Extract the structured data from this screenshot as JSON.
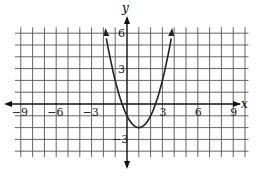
{
  "chart_data": {
    "type": "line",
    "title": "",
    "xlabel": "x",
    "ylabel": "y",
    "function": "y = (x-1)^2 - 2",
    "xlim": [
      -10,
      10
    ],
    "ylim": [
      -5,
      7
    ],
    "x_ticks": [
      "-9",
      "-6",
      "-3",
      "3",
      "6",
      "9"
    ],
    "y_ticks": [
      "6",
      "3",
      "-3"
    ],
    "grid": true,
    "vertex": [
      1,
      -2
    ],
    "x_intercepts": [
      -0.41,
      2.41
    ],
    "y_intercept": -1,
    "series": [
      {
        "name": "parabola",
        "x": [
          -1.83,
          -1,
          0,
          1,
          2,
          3,
          3.83
        ],
        "values": [
          6,
          2,
          -1,
          -2,
          -1,
          2,
          6
        ]
      }
    ]
  },
  "labels": {
    "x_axis": "x",
    "y_axis": "y",
    "xt": [
      "−9",
      "−6",
      "−3",
      "3",
      "6",
      "9"
    ],
    "yt6": "6",
    "yt3": "3",
    "ytm3": "−3"
  }
}
